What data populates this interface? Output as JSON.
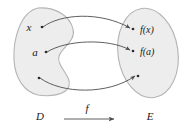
{
  "figure": {
    "type": "set-mapping-diagram",
    "colors": {
      "blob_fill": "#ededed",
      "blob_stroke": "#b4b4b4",
      "arrow_stroke": "#4d4d4d",
      "text": "#1a1a1a",
      "background": "#ffffff"
    }
  },
  "sets": {
    "domain": {
      "label": "D",
      "shape": "kidney-blob",
      "elements": [
        {
          "name": "x",
          "label": "x",
          "has_label": true
        },
        {
          "name": "a",
          "label": "a",
          "has_label": true
        },
        {
          "name": "unlabeled-element",
          "label": "",
          "has_label": false
        }
      ]
    },
    "codomain": {
      "label": "E",
      "shape": "tilted-ellipse",
      "elements": [
        {
          "name": "f-of-x",
          "label": "f(x)",
          "has_label": true
        },
        {
          "name": "f-of-a",
          "label": "f(a)",
          "has_label": true
        },
        {
          "name": "unlabeled-image",
          "label": "",
          "has_label": false
        }
      ]
    }
  },
  "mapping": {
    "label": "f",
    "arrow_label": "f",
    "arrows": [
      {
        "name": "arrow-x-to-fx",
        "from": "x",
        "to": "f(x)",
        "curve": "arc-up"
      },
      {
        "name": "arrow-a-to-fa",
        "from": "a",
        "to": "f(a)",
        "curve": "arc-up"
      },
      {
        "name": "arrow-third",
        "from": "unlabeled-element",
        "to": "unlabeled-image",
        "curve": "arc-down"
      }
    ]
  }
}
